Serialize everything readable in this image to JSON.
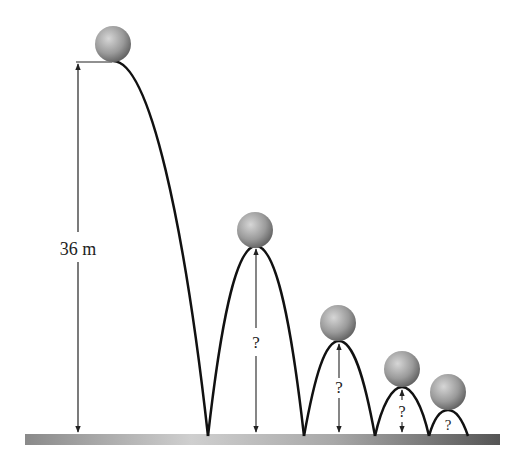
{
  "figure": {
    "initial_height_label": "36 m",
    "unknown_label": "?",
    "colors": {
      "curve": "#111111",
      "ground_dark": "#777777",
      "ground_light": "#d0d0d0",
      "ball_light": "#c8c8c8",
      "ball_dark": "#6f6f6f"
    },
    "bounces": [
      {
        "index": 1,
        "height_label": "?"
      },
      {
        "index": 2,
        "height_label": "?"
      },
      {
        "index": 3,
        "height_label": "?"
      },
      {
        "index": 4,
        "height_label": "?"
      }
    ]
  }
}
